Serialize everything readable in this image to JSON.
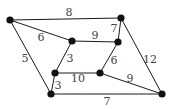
{
  "graph": {
    "nodes": [
      {
        "id": "A",
        "x": 10,
        "y": 20
      },
      {
        "id": "B",
        "x": 121,
        "y": 18
      },
      {
        "id": "C",
        "x": 72,
        "y": 41
      },
      {
        "id": "D",
        "x": 118,
        "y": 42
      },
      {
        "id": "E",
        "x": 55,
        "y": 73
      },
      {
        "id": "F",
        "x": 100,
        "y": 73
      },
      {
        "id": "G",
        "x": 51,
        "y": 94
      },
      {
        "id": "H",
        "x": 162,
        "y": 94
      }
    ],
    "edges": [
      {
        "from": "A",
        "to": "B",
        "weight": "8",
        "lx": 69,
        "ly": 12
      },
      {
        "from": "A",
        "to": "C",
        "weight": "6",
        "lx": 41,
        "ly": 37
      },
      {
        "from": "C",
        "to": "D",
        "weight": "9",
        "lx": 95,
        "ly": 35
      },
      {
        "from": "B",
        "to": "D",
        "weight": "7",
        "lx": 114,
        "ly": 28
      },
      {
        "from": "A",
        "to": "G",
        "weight": "5",
        "lx": 25,
        "ly": 58
      },
      {
        "from": "C",
        "to": "E",
        "weight": "3",
        "lx": 70,
        "ly": 58
      },
      {
        "from": "E",
        "to": "G",
        "weight": "3",
        "lx": 58,
        "ly": 85
      },
      {
        "from": "E",
        "to": "F",
        "weight": "10",
        "lx": 78,
        "ly": 78
      },
      {
        "from": "D",
        "to": "F",
        "weight": "6",
        "lx": 114,
        "ly": 60
      },
      {
        "from": "B",
        "to": "H",
        "weight": "12",
        "lx": 150,
        "ly": 59
      },
      {
        "from": "F",
        "to": "H",
        "weight": "9",
        "lx": 130,
        "ly": 78
      },
      {
        "from": "G",
        "to": "H",
        "weight": "7",
        "lx": 107,
        "ly": 101
      }
    ]
  }
}
